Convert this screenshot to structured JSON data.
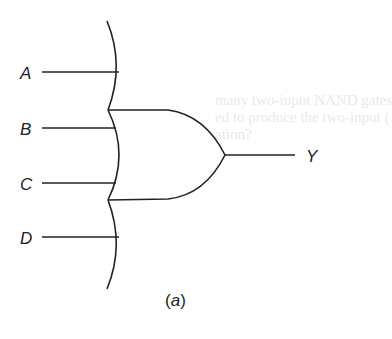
{
  "diagram": {
    "type": "logic-gate",
    "gate": "OR (4-input, extended input line)",
    "inputs": [
      {
        "label": "A"
      },
      {
        "label": "B"
      },
      {
        "label": "C"
      },
      {
        "label": "D"
      }
    ],
    "output": {
      "label": "Y"
    },
    "caption": {
      "open": "(",
      "letter": "a",
      "close": ")"
    },
    "stroke_color": "#222222",
    "background_text": [
      "many two-input NAND gates",
      "ed to produce the two-input (",
      "ation?"
    ]
  }
}
